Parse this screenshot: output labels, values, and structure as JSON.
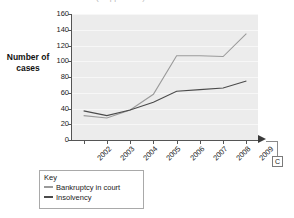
{
  "title_strip": {
    "text": "(cropped title)"
  },
  "legend": {
    "title": "Key",
    "items": [
      {
        "label": "Bankruptcy in court",
        "color": "#9a9a9a"
      },
      {
        "label": "Insolvency",
        "color": "#4a4a4a"
      }
    ]
  },
  "callout": {
    "label": "C"
  },
  "chart_data": {
    "type": "line",
    "title": "",
    "xlabel": "",
    "ylabel": "Number of cases",
    "ylim": [
      0,
      160
    ],
    "ytick_step": 20,
    "yticks": [
      160,
      140,
      120,
      100,
      80,
      60,
      40,
      20,
      0
    ],
    "grid": true,
    "legend_position": "below-left",
    "categories": [
      "2002",
      "2003",
      "2004",
      "2005",
      "2006",
      "2007",
      "2008",
      "2009"
    ],
    "series": [
      {
        "name": "Bankruptcy in court",
        "color": "#9a9a9a",
        "values": [
          31,
          28,
          38,
          58,
          107,
          107,
          106,
          135
        ]
      },
      {
        "name": "Insolvency",
        "color": "#4a4a4a",
        "values": [
          37,
          31,
          38,
          48,
          62,
          64,
          66,
          75
        ]
      }
    ]
  }
}
